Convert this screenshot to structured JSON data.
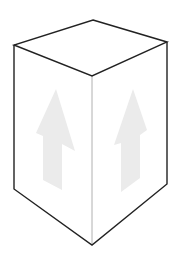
{
  "diagram": {
    "type": "isometric-box",
    "colors": {
      "background": "#ffffff",
      "edge": "#222222",
      "center_edge": "#b0b0b0",
      "arrow": "#ebebeb"
    },
    "box": {
      "top_face": [
        [
          93,
          20
        ],
        [
          167,
          42
        ],
        [
          92,
          76
        ],
        [
          14,
          45
        ]
      ],
      "left_face": [
        [
          14,
          45
        ],
        [
          92,
          76
        ],
        [
          92,
          245
        ],
        [
          14,
          189
        ]
      ],
      "right_face": [
        [
          92,
          76
        ],
        [
          167,
          42
        ],
        [
          167,
          184
        ],
        [
          92,
          245
        ]
      ]
    },
    "arrows": [
      {
        "name": "left-face-up-arrow",
        "points": [
          [
            56,
            89
          ],
          [
            75,
            151
          ],
          [
            62,
            144
          ],
          [
            62,
            190
          ],
          [
            43,
            180
          ],
          [
            43,
            136
          ],
          [
            36,
            133
          ]
        ]
      },
      {
        "name": "right-face-up-arrow",
        "points": [
          [
            133,
            89
          ],
          [
            147,
            130
          ],
          [
            140,
            135
          ],
          [
            140,
            178
          ],
          [
            121,
            192
          ],
          [
            121,
            143
          ],
          [
            114,
            145
          ]
        ]
      }
    ]
  }
}
